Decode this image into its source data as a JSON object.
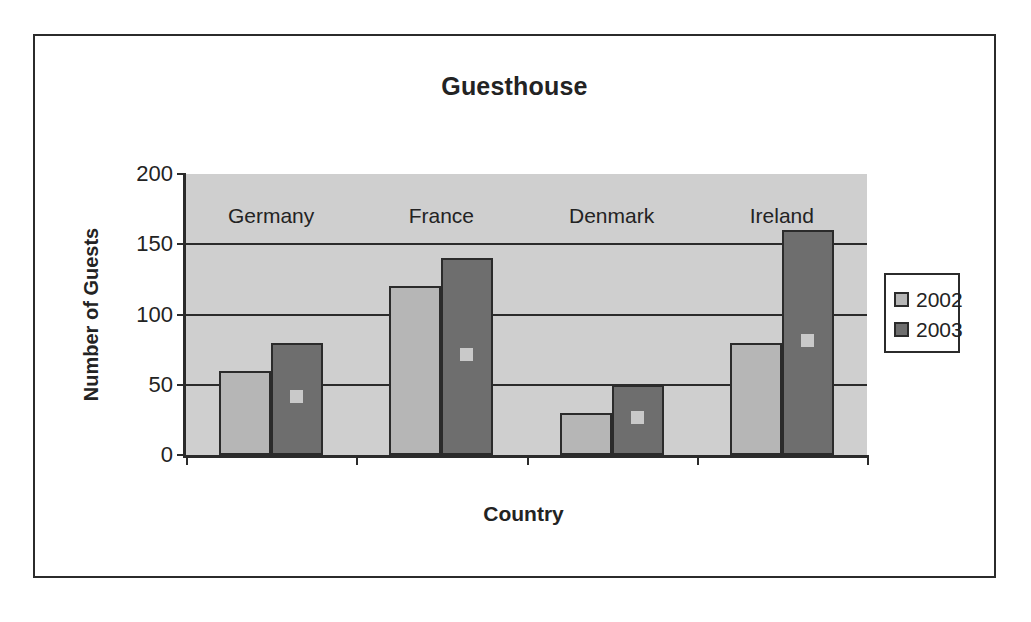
{
  "chart_data": {
    "type": "bar",
    "title": "Guesthouse",
    "xlabel": "Country",
    "ylabel": "Number of Guests",
    "categories": [
      "Germany",
      "France",
      "Denmark",
      "Ireland"
    ],
    "series": [
      {
        "name": "2002",
        "values": [
          60,
          120,
          30,
          80
        ],
        "color": "#b6b6b6"
      },
      {
        "name": "2003",
        "values": [
          80,
          140,
          50,
          160
        ],
        "color": "#6e6e6e"
      }
    ],
    "ylim": [
      0,
      200
    ],
    "yticks": [
      0,
      50,
      100,
      150,
      200
    ],
    "ytick_labels": [
      "0",
      "50",
      "100",
      "150",
      "200"
    ],
    "grid": true,
    "grid_axis": "y",
    "legend_position": "right",
    "plot_background": "#cfcfcf",
    "axis_color": "#2b2b2b",
    "frame": true
  },
  "legend": {
    "entries": [
      {
        "label": "2002",
        "swatch": "light-gray"
      },
      {
        "label": "2003",
        "swatch": "dark-gray"
      }
    ]
  }
}
